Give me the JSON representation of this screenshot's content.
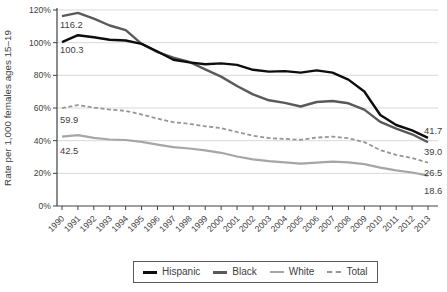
{
  "chart_data": {
    "type": "line",
    "title": "",
    "xlabel": "",
    "ylabel": "Rate per 1,000 females ages 15–19",
    "ylim": [
      0,
      120
    ],
    "y_tick_step": 20,
    "y_tick_labels": [
      "0%",
      "20%",
      "40%",
      "60%",
      "80%",
      "100%",
      "120%"
    ],
    "grid": true,
    "legend_position": "bottom-center-boxed",
    "x": [
      1990,
      1991,
      1992,
      1993,
      1994,
      1995,
      1996,
      1997,
      1998,
      1999,
      2000,
      2001,
      2002,
      2003,
      2004,
      2005,
      2006,
      2007,
      2008,
      2009,
      2010,
      2011,
      2012,
      2013
    ],
    "series": [
      {
        "name": "Hispanic",
        "color": "#0d0d0d",
        "style": "solid",
        "stroke_width": 2.4,
        "start_label": "100.3",
        "end_label": "41.7",
        "values": [
          100.3,
          104.6,
          103.3,
          101.8,
          101.3,
          99.3,
          94.6,
          89.6,
          87.9,
          86.8,
          87.3,
          86.4,
          83.4,
          82.3,
          82.6,
          81.7,
          83.0,
          81.7,
          77.4,
          70.1,
          55.7,
          49.6,
          46.3,
          41.7
        ]
      },
      {
        "name": "Black",
        "color": "#595959",
        "style": "solid",
        "stroke_width": 2.4,
        "start_label": "116.2",
        "end_label": "39.0",
        "values": [
          116.2,
          118.2,
          114.7,
          110.5,
          107.7,
          99.3,
          94.2,
          90.8,
          88.2,
          83.7,
          79.2,
          73.5,
          68.3,
          64.7,
          63.1,
          60.9,
          63.7,
          64.3,
          62.9,
          59.0,
          51.5,
          47.3,
          43.9,
          39.0
        ]
      },
      {
        "name": "White",
        "color": "#a6a6a6",
        "style": "solid",
        "stroke_width": 2.2,
        "start_label": "42.5",
        "end_label": "18.6",
        "values": [
          42.5,
          43.4,
          41.7,
          40.7,
          40.4,
          39.3,
          37.6,
          36.0,
          35.2,
          34.1,
          32.6,
          30.3,
          28.6,
          27.4,
          26.7,
          25.9,
          26.6,
          27.2,
          26.7,
          25.6,
          23.5,
          21.8,
          20.5,
          18.6
        ]
      },
      {
        "name": "Total",
        "color": "#969696",
        "style": "dashed",
        "stroke_width": 1.8,
        "start_label": "59.9",
        "end_label": "26.5",
        "values": [
          59.9,
          61.8,
          60.3,
          59.0,
          58.2,
          56.0,
          53.5,
          51.3,
          50.3,
          48.8,
          47.7,
          45.3,
          43.0,
          41.6,
          41.1,
          40.5,
          41.9,
          42.5,
          41.5,
          39.1,
          34.2,
          31.3,
          29.4,
          26.5
        ]
      }
    ],
    "colors": {
      "grid": "#d9d9d9",
      "axis": "#404040",
      "text": "#404040",
      "background": "#ffffff",
      "legend_border": "#595959"
    }
  }
}
